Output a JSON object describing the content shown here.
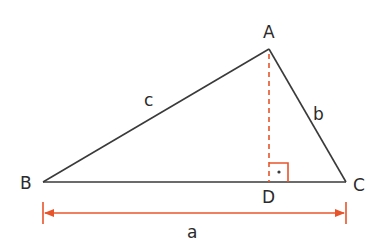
{
  "diagram": {
    "type": "right-triangle-altitude",
    "colors": {
      "edge": "#3a3a3a",
      "accent": "#e8542a"
    },
    "vertices": {
      "A": {
        "label": "A"
      },
      "B": {
        "label": "B"
      },
      "C": {
        "label": "C"
      },
      "D": {
        "label": "D"
      }
    },
    "sides": {
      "a": {
        "label": "a"
      },
      "b": {
        "label": "b"
      },
      "c": {
        "label": "c"
      }
    }
  }
}
